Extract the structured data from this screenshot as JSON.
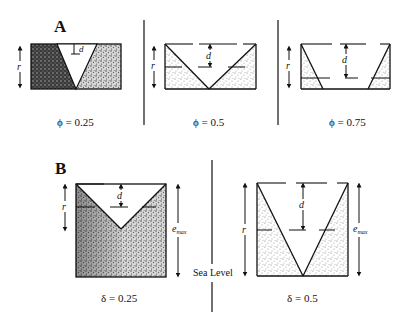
{
  "panel_a": {
    "label": "A",
    "cases": [
      {
        "caption": "ϕ = 0.25",
        "dim_r": "r",
        "dim_d": "d"
      },
      {
        "caption": "ϕ = 0.5",
        "dim_r": "r",
        "dim_d": "d"
      },
      {
        "caption": "ϕ = 0.75",
        "dim_r": "r",
        "dim_d": "d"
      }
    ]
  },
  "panel_b": {
    "label": "B",
    "divider_label": "Sea Level",
    "cases": [
      {
        "caption": "δ = 0.25",
        "dim_r": "r",
        "dim_d": "d",
        "dim_e": "e",
        "dim_e_sub": "max"
      },
      {
        "caption": "δ = 0.5",
        "dim_r": "r",
        "dim_d": "d",
        "dim_e": "e",
        "dim_e_sub": "max"
      }
    ]
  },
  "colors": {
    "ink": "#111111",
    "stipple_dark": "#2a2a2a",
    "stipple_light": "#9a9a9a",
    "background": "#ffffff"
  }
}
